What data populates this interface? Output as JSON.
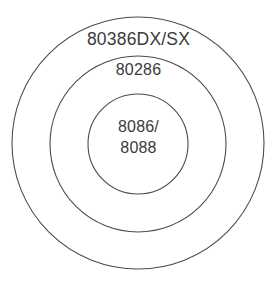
{
  "diagram": {
    "type": "concentric-circles",
    "background_color": "#ffffff",
    "stroke_color": "#4b4b4b",
    "text_color": "#3b3b3b",
    "rings": [
      {
        "id": "outer",
        "label": "80386DX/SX",
        "center_x": 138,
        "center_y": 143,
        "radius": 126
      },
      {
        "id": "middle",
        "label": "80286",
        "center_x": 138,
        "center_y": 144,
        "radius": 88
      },
      {
        "id": "inner",
        "label_line_1": "8086/",
        "label_line_2": "8088",
        "center_x": 138,
        "center_y": 144,
        "radius": 50
      }
    ]
  }
}
